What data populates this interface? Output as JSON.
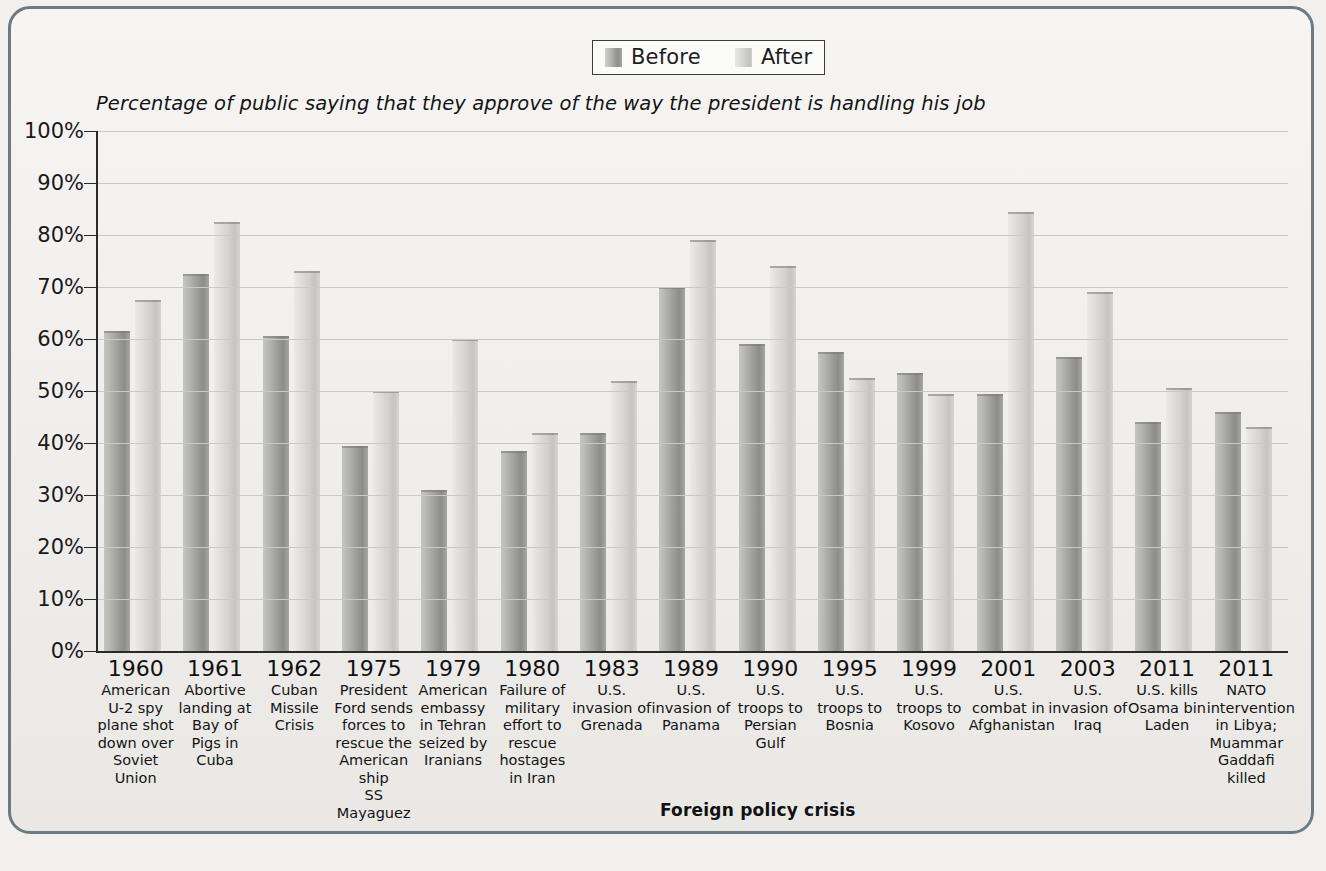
{
  "legend": {
    "items": [
      {
        "label": "Before",
        "key": "before",
        "color": "#9d9d9a"
      },
      {
        "label": "After",
        "key": "after",
        "color": "#d2d1ce"
      }
    ]
  },
  "subtitle": "Percentage of public saying that they approve of the way the president is handling his job",
  "axis_title": "Foreign policy crisis",
  "chart_data": {
    "type": "bar",
    "title": "",
    "subtitle": "Percentage of public saying that they approve of the way the president is handling his job",
    "xlabel": "Foreign policy crisis",
    "ylabel": "",
    "ylim": [
      0,
      100
    ],
    "yticks": [
      "0%",
      "10%",
      "20%",
      "30%",
      "40%",
      "50%",
      "60%",
      "70%",
      "80%",
      "90%",
      "100%"
    ],
    "ytick_values": [
      0,
      10,
      20,
      30,
      40,
      50,
      60,
      70,
      80,
      90,
      100
    ],
    "grid": true,
    "legend_position": "top-center",
    "categories": [
      {
        "year": "1960",
        "desc": "American U-2 spy plane shot down over Soviet Union"
      },
      {
        "year": "1961",
        "desc": "Abortive landing at Bay of Pigs in Cuba"
      },
      {
        "year": "1962",
        "desc": "Cuban Missile Crisis"
      },
      {
        "year": "1975",
        "desc": "President Ford sends forces to rescue the American ship",
        "italic_tail": "SS Mayaguez"
      },
      {
        "year": "1979",
        "desc": "American embassy in Tehran seized by Iranians"
      },
      {
        "year": "1980",
        "desc": "Failure of military effort to rescue hostages in Iran"
      },
      {
        "year": "1983",
        "desc": "U.S. invasion of Grenada"
      },
      {
        "year": "1989",
        "desc": "U.S. invasion of Panama"
      },
      {
        "year": "1990",
        "desc": "U.S. troops to Persian Gulf"
      },
      {
        "year": "1995",
        "desc": "U.S. troops to Bosnia"
      },
      {
        "year": "1999",
        "desc": "U.S. troops to Kosovo"
      },
      {
        "year": "2001",
        "desc": "U.S. combat in Afghanistan"
      },
      {
        "year": "2003",
        "desc": "U.S. invasion of Iraq"
      },
      {
        "year": "2011",
        "desc": "U.S. kills Osama bin Laden"
      },
      {
        "year": "2011",
        "desc": "NATO intervention in Libya; Muammar Gaddafi killed"
      }
    ],
    "series": [
      {
        "name": "Before",
        "values": [
          61.5,
          72.5,
          60.5,
          39.5,
          31.0,
          38.5,
          42.0,
          70.0,
          59.0,
          57.5,
          53.5,
          49.5,
          56.5,
          44.0,
          46.0
        ]
      },
      {
        "name": "After",
        "values": [
          67.5,
          82.5,
          73.0,
          50.0,
          60.0,
          42.0,
          52.0,
          79.0,
          74.0,
          52.5,
          49.5,
          84.5,
          69.0,
          50.5,
          43.0
        ]
      }
    ]
  }
}
